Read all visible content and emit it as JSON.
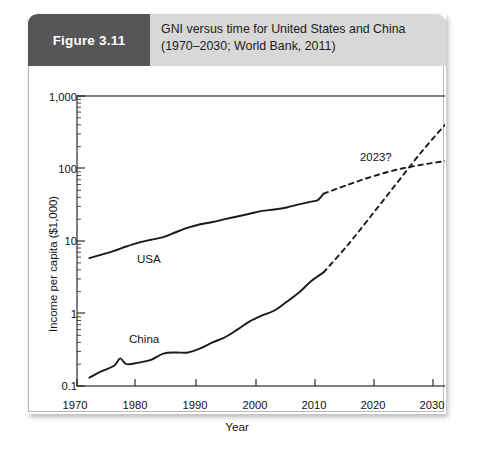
{
  "figure": {
    "badge_label": "Figure 3.11",
    "title_line1": "GNI versus time for United States and China",
    "title_line2": "(1970–2030; World Bank, 2011)",
    "badge_color": "#565656",
    "header_color": "#d8d8d8"
  },
  "chart_data": {
    "type": "line",
    "title": "GNI versus time for United States and China",
    "subtitle": "(1970–2030; World Bank, 2011)",
    "xlabel": "Year",
    "ylabel": "Income per capita ($1,000)",
    "xlim": [
      1970,
      2030
    ],
    "ylim": [
      0.1,
      1000
    ],
    "yscale": "log",
    "grid": false,
    "legend": "inline-labels",
    "xticks": [
      1970,
      1980,
      1990,
      2000,
      2010,
      2020,
      2030
    ],
    "xtick_labels": [
      "1970",
      "1980",
      "1990",
      "2000",
      "2010",
      "2020",
      "2030"
    ],
    "yticks": [
      0.1,
      1,
      10,
      100,
      1000
    ],
    "ytick_labels": [
      "0.1",
      "1",
      "10",
      "100",
      "1,000"
    ],
    "annotations": [
      {
        "text": "2023?",
        "x": 2023,
        "y": 110,
        "note": "crossover point of projected curves"
      }
    ],
    "series": [
      {
        "name": "USA",
        "label": "USA",
        "style": "solid",
        "color": "#1a1a1a",
        "x": [
          1972,
          1974,
          1976,
          1978,
          1980,
          1982,
          1984,
          1986,
          1988,
          1990,
          1992,
          1994,
          1996,
          1998,
          2000,
          2002,
          2004,
          2006,
          2008,
          2009,
          2010
        ],
        "y": [
          5.8,
          6.5,
          7.3,
          8.4,
          9.5,
          10.4,
          11.3,
          13.2,
          15.3,
          17.0,
          18.3,
          20.0,
          21.8,
          23.8,
          26.0,
          27.2,
          29.0,
          32.0,
          35.0,
          36.5,
          45.0
        ]
      },
      {
        "name": "USA projection",
        "label": "",
        "style": "dashed",
        "color": "#1a1a1a",
        "x": [
          2010,
          2014,
          2018,
          2022,
          2026,
          2030
        ],
        "y": [
          45.0,
          60.0,
          78.0,
          97.0,
          113.0,
          128.0
        ]
      },
      {
        "name": "China",
        "label": "China",
        "style": "solid",
        "color": "#1a1a1a",
        "x": [
          1972,
          1974,
          1976,
          1977,
          1978,
          1980,
          1982,
          1984,
          1986,
          1988,
          1990,
          1992,
          1994,
          1996,
          1998,
          2000,
          2002,
          2004,
          2006,
          2008,
          2010
        ],
        "y": [
          0.13,
          0.16,
          0.19,
          0.24,
          0.2,
          0.21,
          0.23,
          0.28,
          0.29,
          0.29,
          0.33,
          0.4,
          0.47,
          0.6,
          0.78,
          0.94,
          1.1,
          1.45,
          1.95,
          2.8,
          3.7
        ]
      },
      {
        "name": "China projection",
        "label": "",
        "style": "dashed",
        "color": "#1a1a1a",
        "x": [
          2010,
          2014,
          2018,
          2022,
          2026,
          2030
        ],
        "y": [
          3.7,
          9.0,
          24.0,
          65.0,
          175.0,
          430.0
        ]
      }
    ]
  }
}
